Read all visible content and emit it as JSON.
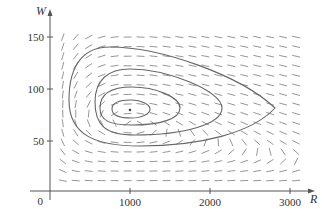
{
  "chart_data": {
    "type": "direction-field-phase-portrait",
    "title": "",
    "xlabel": "R",
    "ylabel": "W",
    "x_ticks": [
      1000,
      2000,
      3000
    ],
    "y_ticks": [
      50,
      100,
      150
    ],
    "origin_label": "0",
    "xlim": [
      0,
      3250
    ],
    "ylim": [
      0,
      170
    ],
    "grid": false,
    "equilibrium": {
      "R": 1000,
      "W": 80
    },
    "field_grid": {
      "R_start": 160,
      "R_step": 162,
      "R_count": 19,
      "W_start": 10,
      "W_step": 9.2,
      "W_count": 16
    },
    "orbits": [
      {
        "name": "orbit-1",
        "R_min": 780,
        "R_max": 1250,
        "W_min": 70,
        "W_max": 88
      },
      {
        "name": "orbit-2",
        "R_min": 625,
        "R_max": 1630,
        "W_min": 63,
        "W_max": 100
      },
      {
        "name": "orbit-3",
        "R_min": 560,
        "R_max": 2150,
        "W_min": 54,
        "W_max": 117
      },
      {
        "name": "orbit-4",
        "R_min": 240,
        "R_max": 2820,
        "W_min": 43,
        "W_max": 139
      }
    ],
    "colors": {
      "axis": "#555555",
      "field": "#8a8a8a",
      "orbit": "#666666"
    }
  },
  "axes": {
    "x_label": "R",
    "y_label": "W",
    "origin": "0",
    "x_tick_labels": [
      "1000",
      "2000",
      "3000"
    ],
    "y_tick_labels": [
      "50",
      "100",
      "150"
    ]
  }
}
